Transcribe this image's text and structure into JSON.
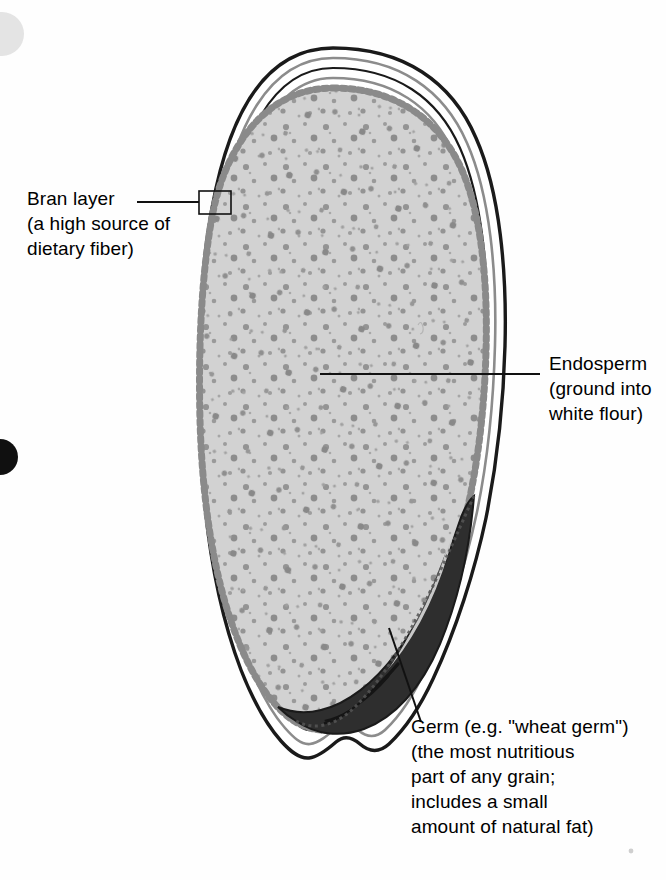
{
  "diagram": {
    "background_color": "#fefefe"
  },
  "labels": {
    "bran": {
      "name": "Bran layer",
      "lines": [
        "Bran layer",
        "(a high source of",
        "dietary fiber)"
      ]
    },
    "endosperm": {
      "name": "Endosperm",
      "lines": [
        "Endosperm",
        "(ground into",
        "white flour)"
      ]
    },
    "germ": {
      "name": "Germ",
      "lines": [
        "Germ (e.g. \"wheat germ\")",
        "(the most nutritious",
        "part of any grain;",
        "includes a small",
        "amount of natural fat)"
      ]
    }
  },
  "colors": {
    "outline": "#1a1a1a",
    "bran_band": "#ffffff",
    "bran_band_gray": "#a9a9a9",
    "aleurone_dots": "#8a8a8a",
    "endosperm_fill": "#d2d2d2",
    "endosperm_speckle": "#909090",
    "germ_dark": "#2e2e2e",
    "germ_mid": "#4a4a4a",
    "germ_light": "#c8c8c8",
    "leader_line": "#111111",
    "artifact_light": "#e4e4e4",
    "artifact_dark": "#101010"
  },
  "parts": [
    {
      "id": "bran",
      "label": "Bran layer",
      "role": "outer multi-layer coat"
    },
    {
      "id": "endosperm",
      "label": "Endosperm",
      "role": "large speckled interior"
    },
    {
      "id": "germ",
      "label": "Germ",
      "role": "dark contoured embryo at lower right"
    }
  ],
  "artifacts": [
    {
      "name": "scan-smudge-light",
      "x": 0,
      "y": 12,
      "r": 22,
      "color": "#e4e4e4"
    },
    {
      "name": "scan-smudge-dark",
      "x": 0,
      "y": 440,
      "r": 18,
      "color": "#101010"
    }
  ]
}
